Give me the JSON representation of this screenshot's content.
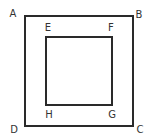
{
  "diagram": {
    "title": "",
    "colors": {
      "stroke": "#2a2a2a",
      "label": "#333333",
      "background": "#ffffff"
    },
    "outer_square": {
      "x": 24,
      "y": 15,
      "width": 109,
      "height": 111,
      "vertices": {
        "A": {
          "label": "A",
          "x": 12,
          "y": 13
        },
        "B": {
          "label": "B",
          "x": 139,
          "y": 14
        },
        "C": {
          "label": "C",
          "x": 140,
          "y": 130
        },
        "D": {
          "label": "D",
          "x": 13,
          "y": 130
        }
      }
    },
    "inner_square": {
      "x": 45,
      "y": 36,
      "width": 67,
      "height": 69,
      "vertices": {
        "E": {
          "label": "E",
          "x": 47,
          "y": 27
        },
        "F": {
          "label": "F",
          "x": 110,
          "y": 27
        },
        "G": {
          "label": "G",
          "x": 112,
          "y": 114
        },
        "H": {
          "label": "H",
          "x": 48,
          "y": 114
        }
      }
    }
  }
}
